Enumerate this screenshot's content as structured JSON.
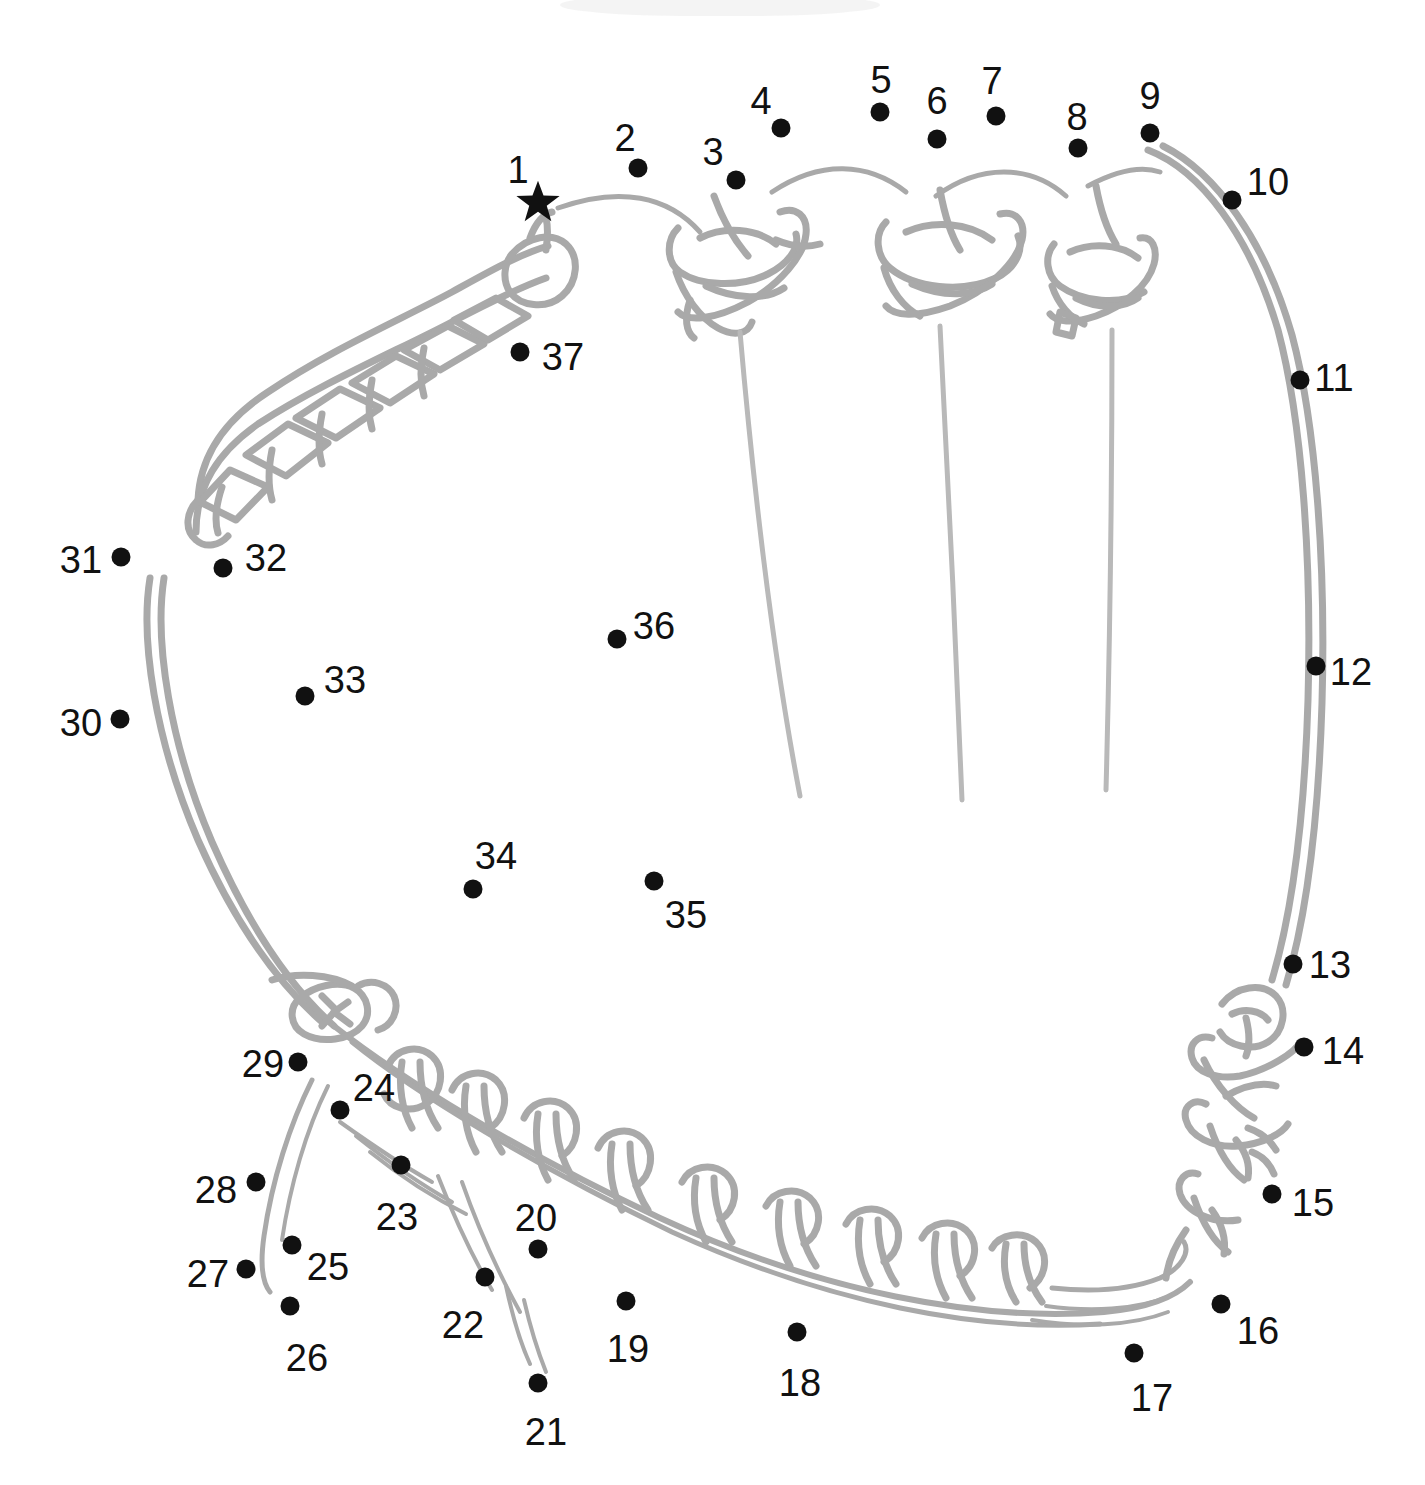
{
  "puzzle": {
    "type": "connect-the-dots",
    "subject": "baseball glove",
    "total_dots": 37,
    "start_marker": "star",
    "canvas": {
      "width": 1425,
      "height": 1485
    },
    "colors": {
      "background": "#ffffff",
      "dot": "#111111",
      "label": "#111111",
      "artwork_outline": "#a8a8a8",
      "artwork_detail": "#bdbdbd"
    }
  },
  "dots": [
    {
      "n": "1",
      "x": 538,
      "y": 202,
      "marker": "star",
      "lx": 518,
      "ly": 170
    },
    {
      "n": "2",
      "x": 638,
      "y": 168,
      "marker": "dot",
      "lx": 625,
      "ly": 138
    },
    {
      "n": "3",
      "x": 736,
      "y": 180,
      "marker": "dot",
      "lx": 713,
      "ly": 152
    },
    {
      "n": "4",
      "x": 781,
      "y": 128,
      "marker": "dot",
      "lx": 761,
      "ly": 101
    },
    {
      "n": "5",
      "x": 880,
      "y": 112,
      "marker": "dot",
      "lx": 881,
      "ly": 80
    },
    {
      "n": "6",
      "x": 937,
      "y": 139,
      "marker": "dot",
      "lx": 937,
      "ly": 101
    },
    {
      "n": "7",
      "x": 996,
      "y": 116,
      "marker": "dot",
      "lx": 992,
      "ly": 81
    },
    {
      "n": "8",
      "x": 1078,
      "y": 148,
      "marker": "dot",
      "lx": 1077,
      "ly": 117
    },
    {
      "n": "9",
      "x": 1150,
      "y": 133,
      "marker": "dot",
      "lx": 1150,
      "ly": 96
    },
    {
      "n": "10",
      "x": 1232,
      "y": 200,
      "marker": "dot",
      "lx": 1268,
      "ly": 182
    },
    {
      "n": "11",
      "x": 1300,
      "y": 380,
      "marker": "dot",
      "lx": 1334,
      "ly": 378
    },
    {
      "n": "12",
      "x": 1316,
      "y": 666,
      "marker": "dot",
      "lx": 1351,
      "ly": 672
    },
    {
      "n": "13",
      "x": 1293,
      "y": 964,
      "marker": "dot",
      "lx": 1330,
      "ly": 965
    },
    {
      "n": "14",
      "x": 1304,
      "y": 1047,
      "marker": "dot",
      "lx": 1343,
      "ly": 1051
    },
    {
      "n": "15",
      "x": 1272,
      "y": 1194,
      "marker": "dot",
      "lx": 1313,
      "ly": 1203
    },
    {
      "n": "16",
      "x": 1221,
      "y": 1304,
      "marker": "dot",
      "lx": 1258,
      "ly": 1331
    },
    {
      "n": "17",
      "x": 1134,
      "y": 1353,
      "marker": "dot",
      "lx": 1152,
      "ly": 1398
    },
    {
      "n": "18",
      "x": 797,
      "y": 1332,
      "marker": "dot",
      "lx": 800,
      "ly": 1383
    },
    {
      "n": "19",
      "x": 626,
      "y": 1301,
      "marker": "dot",
      "lx": 628,
      "ly": 1349
    },
    {
      "n": "20",
      "x": 538,
      "y": 1249,
      "marker": "dot",
      "lx": 536,
      "ly": 1218
    },
    {
      "n": "21",
      "x": 538,
      "y": 1383,
      "marker": "dot",
      "lx": 546,
      "ly": 1432
    },
    {
      "n": "22",
      "x": 485,
      "y": 1277,
      "marker": "dot",
      "lx": 463,
      "ly": 1325
    },
    {
      "n": "23",
      "x": 401,
      "y": 1165,
      "marker": "dot",
      "lx": 397,
      "ly": 1217
    },
    {
      "n": "24",
      "x": 340,
      "y": 1110,
      "marker": "dot",
      "lx": 374,
      "ly": 1088
    },
    {
      "n": "25",
      "x": 292,
      "y": 1245,
      "marker": "dot",
      "lx": 328,
      "ly": 1267
    },
    {
      "n": "26",
      "x": 290,
      "y": 1306,
      "marker": "dot",
      "lx": 307,
      "ly": 1358
    },
    {
      "n": "27",
      "x": 246,
      "y": 1269,
      "marker": "dot",
      "lx": 208,
      "ly": 1274
    },
    {
      "n": "28",
      "x": 256,
      "y": 1182,
      "marker": "dot",
      "lx": 216,
      "ly": 1190
    },
    {
      "n": "29",
      "x": 298,
      "y": 1062,
      "marker": "dot",
      "lx": 263,
      "ly": 1064
    },
    {
      "n": "30",
      "x": 120,
      "y": 719,
      "marker": "dot",
      "lx": 81,
      "ly": 723
    },
    {
      "n": "31",
      "x": 121,
      "y": 557,
      "marker": "dot",
      "lx": 81,
      "ly": 560
    },
    {
      "n": "32",
      "x": 223,
      "y": 568,
      "marker": "dot",
      "lx": 266,
      "ly": 558
    },
    {
      "n": "33",
      "x": 305,
      "y": 696,
      "marker": "dot",
      "lx": 345,
      "ly": 680
    },
    {
      "n": "34",
      "x": 473,
      "y": 889,
      "marker": "dot",
      "lx": 496,
      "ly": 856
    },
    {
      "n": "35",
      "x": 654,
      "y": 881,
      "marker": "dot",
      "lx": 686,
      "ly": 915
    },
    {
      "n": "36",
      "x": 617,
      "y": 639,
      "marker": "dot",
      "lx": 654,
      "ly": 626
    },
    {
      "n": "37",
      "x": 520,
      "y": 352,
      "marker": "dot",
      "lx": 563,
      "ly": 357
    }
  ]
}
